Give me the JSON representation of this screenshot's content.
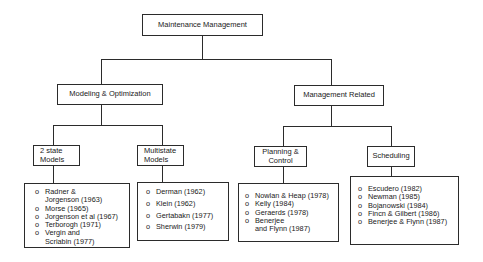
{
  "diagram": {
    "root": {
      "label": "Maintenance Management"
    },
    "branches": [
      {
        "label": "Modeling & Optimization",
        "children": [
          {
            "label": "2 state Models",
            "label_lines": [
              "2 state",
              "Models"
            ],
            "references": [
              {
                "lines": [
                  "Radner &",
                  "Jorgenson (1963)"
                ]
              },
              {
                "lines": [
                  "Morse (1965)"
                ]
              },
              {
                "lines": [
                  "Jorgenson et al (1967)"
                ]
              },
              {
                "lines": [
                  "Terborogh (1971)"
                ]
              },
              {
                "lines": [
                  "Vergin and",
                  "Scriabin (1977)"
                ]
              }
            ]
          },
          {
            "label": "Multistate Models",
            "label_lines": [
              "Multistate",
              "Models"
            ],
            "references": [
              {
                "lines": [
                  "Derman (1962)"
                ]
              },
              {
                "lines": [
                  "Klein (1962)"
                ]
              },
              {
                "lines": [
                  "Gertabakn (1977)"
                ]
              },
              {
                "lines": [
                  "Sherwin (1979)"
                ]
              }
            ]
          }
        ]
      },
      {
        "label": "Management Related",
        "children": [
          {
            "label": "Planning & Control",
            "label_lines": [
              "Planning &",
              "Control"
            ],
            "references": [
              {
                "lines": [
                  "Nowlan & Heap (1978)"
                ]
              },
              {
                "lines": [
                  "Kelly (1984)"
                ]
              },
              {
                "lines": [
                  "Geraerds (1978)"
                ]
              },
              {
                "lines": [
                  "Benerjee",
                  "and Flynn (1987)"
                ]
              }
            ]
          },
          {
            "label": "Scheduling",
            "label_lines": [
              "Scheduling"
            ],
            "references": [
              {
                "lines": [
                  "Escudero (1982)"
                ]
              },
              {
                "lines": [
                  "Newman (1985)"
                ]
              },
              {
                "lines": [
                  "Bojanowski (1984)"
                ]
              },
              {
                "lines": [
                  "Fincn & Gilbert (1986)"
                ]
              },
              {
                "lines": [
                  "Benerjee & Flynn (1987)"
                ]
              }
            ]
          }
        ]
      }
    ],
    "bullet": "o"
  }
}
